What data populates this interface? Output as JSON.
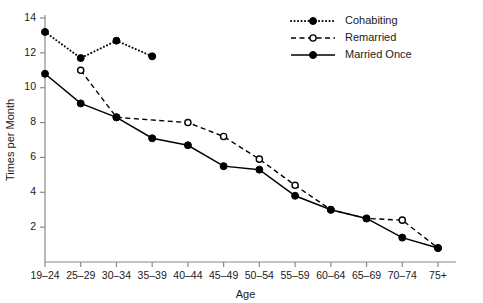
{
  "chart_data": {
    "type": "line",
    "title": "",
    "xlabel": "Age",
    "ylabel": "Times per Month",
    "categories": [
      "19–24",
      "25–29",
      "30–34",
      "35–39",
      "40–44",
      "45–49",
      "50–54",
      "55–59",
      "60–64",
      "65–69",
      "70–74",
      "75+"
    ],
    "ylim": [
      0,
      14
    ],
    "yticks": [
      2,
      4,
      6,
      8,
      10,
      12,
      14
    ],
    "ytick_labels": [
      "2",
      "4",
      "6",
      "8",
      "10",
      "12",
      "14"
    ],
    "grid": false,
    "legend_position": "top-right",
    "series": [
      {
        "name": "Cohabiting",
        "line_style": "dotted",
        "marker": "filled-circle",
        "color": "#000000",
        "values": [
          13.2,
          11.7,
          12.7,
          11.8,
          null,
          null,
          null,
          null,
          null,
          null,
          null,
          null
        ]
      },
      {
        "name": "Remarried",
        "line_style": "dashed",
        "marker": "open-circle",
        "color": "#000000",
        "values": [
          null,
          11.0,
          8.3,
          null,
          8.0,
          7.2,
          5.9,
          4.4,
          3.0,
          2.5,
          2.4,
          0.8
        ]
      },
      {
        "name": "Married Once",
        "line_style": "solid",
        "marker": "filled-circle",
        "color": "#000000",
        "values": [
          10.8,
          9.1,
          8.3,
          7.1,
          6.7,
          5.5,
          5.3,
          3.8,
          3.0,
          2.5,
          1.4,
          0.8
        ]
      }
    ]
  },
  "legend": {
    "items": [
      {
        "label": "Cohabiting"
      },
      {
        "label": "Remarried"
      },
      {
        "label": "Married Once"
      }
    ]
  }
}
